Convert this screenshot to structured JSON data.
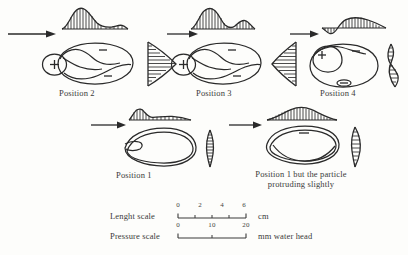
{
  "figure": {
    "background": "#fdfdfb",
    "ink": "#2a2a2a"
  },
  "panels": [
    {
      "id": "position-2",
      "caption": "Position 2",
      "flow_arrow": "right",
      "signs": [
        "+",
        "–",
        "–"
      ],
      "pressure_curve": "tall-left-peak-with-low-tail",
      "side_profile": "right-pointing-triangle-hatched"
    },
    {
      "id": "position-3",
      "caption": "Position 3",
      "flow_arrow": "right",
      "signs": [
        "+",
        "–",
        "–"
      ],
      "pressure_curve": "tall-left-peak-with-secondary-bump",
      "side_profile": "left-pointing-triangle-hatched"
    },
    {
      "id": "position-4",
      "caption": "Position 4",
      "flow_arrow": "right",
      "signs": [
        "+",
        "–",
        "–"
      ],
      "pressure_curve": "negative-dip-then-hatched-hump",
      "side_profile": "s-shaped-hatched-profile"
    },
    {
      "id": "position-1",
      "caption": "Position 1",
      "flow_arrow": "right",
      "signs": [],
      "pressure_curve": "low-flat-with-small-left-peak",
      "side_profile": "narrow-vertical-hatched-sliver"
    },
    {
      "id": "position-1-protruding",
      "caption": "Position 1 but the particle protruding slightly",
      "flow_arrow": "right",
      "signs": [
        "–"
      ],
      "pressure_curve": "symmetric-hatched-dome",
      "side_profile": "narrow-leaf-hatched-sliver"
    }
  ],
  "scales": [
    {
      "label": "Lenght scale",
      "ticks": [
        "0",
        "2",
        "4",
        "6"
      ],
      "unit": "cm"
    },
    {
      "label": "Pressure scale",
      "ticks": [
        "0",
        "10",
        "20"
      ],
      "unit": "mm water head"
    }
  ]
}
